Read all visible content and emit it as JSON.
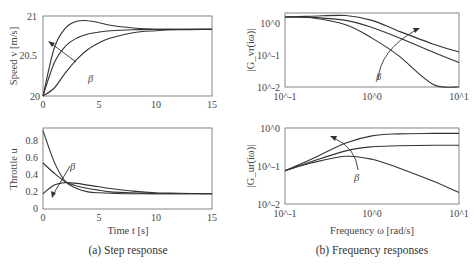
{
  "captions": {
    "left": "(a) Step response",
    "right": "(b) Frequency responses"
  },
  "parameter_label": "β",
  "chart_data": [
    {
      "type": "line",
      "title": "Speed step response",
      "xlabel": "",
      "ylabel": "Speed v [m/s]",
      "xlim": [
        0,
        15
      ],
      "ylim": [
        20,
        21.2
      ],
      "xticks": [
        "0",
        "5",
        "10",
        "15"
      ],
      "yticks": [
        "20",
        "20.5",
        "21"
      ],
      "annotation": "β (arrow pointing toward faster response)",
      "x": [
        0,
        1,
        2,
        3,
        4,
        5,
        6,
        8,
        10,
        12,
        15
      ],
      "series": [
        {
          "name": "beta_high",
          "values": [
            20,
            20.72,
            21.02,
            21.12,
            21.13,
            21.1,
            21.06,
            21.02,
            21.0,
            21.0,
            21.0
          ]
        },
        {
          "name": "beta_mid",
          "values": [
            20,
            20.5,
            20.75,
            20.87,
            20.93,
            20.96,
            20.98,
            20.995,
            21.0,
            21.0,
            21.0
          ]
        },
        {
          "name": "beta_low",
          "values": [
            20,
            20.12,
            20.35,
            20.55,
            20.7,
            20.8,
            20.87,
            20.95,
            20.98,
            20.995,
            21.0
          ]
        }
      ]
    },
    {
      "type": "line",
      "title": "Throttle step response",
      "xlabel": "Time t [s]",
      "ylabel": "Throttle u",
      "xlim": [
        0,
        15
      ],
      "ylim": [
        0,
        0.95
      ],
      "xticks": [
        "0",
        "5",
        "10",
        "15"
      ],
      "yticks": [
        "0",
        "0.2",
        "0.4",
        "0.6",
        "0.8"
      ],
      "annotation": "β",
      "x": [
        0,
        1,
        2,
        3,
        4,
        5,
        6,
        8,
        10,
        12,
        15
      ],
      "series": [
        {
          "name": "beta_high",
          "values": [
            0.92,
            0.55,
            0.32,
            0.24,
            0.2,
            0.19,
            0.185,
            0.18,
            0.18,
            0.18,
            0.18
          ]
        },
        {
          "name": "beta_mid",
          "values": [
            0.54,
            0.42,
            0.32,
            0.27,
            0.24,
            0.22,
            0.2,
            0.19,
            0.18,
            0.18,
            0.18
          ]
        },
        {
          "name": "beta_low",
          "values": [
            0.18,
            0.28,
            0.31,
            0.3,
            0.28,
            0.26,
            0.24,
            0.21,
            0.19,
            0.185,
            0.18
          ]
        }
      ]
    },
    {
      "type": "line",
      "title": "|G_vr(iω)|",
      "xlabel": "",
      "ylabel": "|G_vr(iω)|",
      "xscale": "log",
      "yscale": "log",
      "xlim": [
        0.1,
        10
      ],
      "ylim": [
        0.01,
        1.3
      ],
      "xticks": [
        "10^-1",
        "10^0",
        "10^1"
      ],
      "yticks": [
        "10^-2",
        "10^-1",
        "10^0"
      ],
      "annotation": "β",
      "x": [
        0.1,
        0.2,
        0.5,
        1,
        2,
        5,
        10
      ],
      "series": [
        {
          "name": "beta_high",
          "values": [
            1.0,
            1.05,
            1.1,
            0.8,
            0.4,
            0.17,
            0.1
          ]
        },
        {
          "name": "beta_mid",
          "values": [
            1.0,
            0.98,
            0.8,
            0.5,
            0.26,
            0.1,
            0.05
          ]
        },
        {
          "name": "beta_low",
          "values": [
            1.0,
            0.95,
            0.6,
            0.25,
            0.08,
            0.012,
            0.003
          ]
        }
      ]
    },
    {
      "type": "line",
      "title": "|G_ur(iω)|",
      "xlabel": "Frequency ω [rad/s]",
      "ylabel": "|G_ur(iω)|",
      "xscale": "log",
      "yscale": "log",
      "xlim": [
        0.1,
        10
      ],
      "ylim": [
        0.01,
        1
      ],
      "xticks": [
        "10^-1",
        "10^0",
        "10^1"
      ],
      "yticks": [
        "10^-2",
        "10^-1",
        "10^0"
      ],
      "annotation": "β",
      "x": [
        0.1,
        0.2,
        0.5,
        1,
        2,
        5,
        10
      ],
      "series": [
        {
          "name": "beta_high",
          "values": [
            0.075,
            0.15,
            0.4,
            0.62,
            0.7,
            0.72,
            0.72
          ]
        },
        {
          "name": "beta_mid",
          "values": [
            0.075,
            0.13,
            0.25,
            0.32,
            0.34,
            0.35,
            0.35
          ]
        },
        {
          "name": "beta_low",
          "values": [
            0.075,
            0.12,
            0.18,
            0.15,
            0.09,
            0.04,
            0.02
          ]
        }
      ]
    }
  ]
}
